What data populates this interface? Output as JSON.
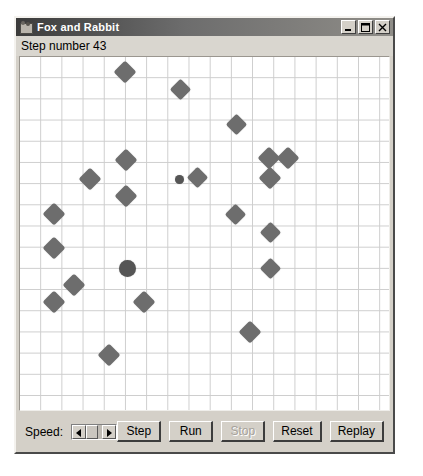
{
  "window": {
    "title": "Fox and Rabbit",
    "icon": "application-icon",
    "controls": [
      {
        "name": "minimize-button",
        "glyph": "minimize-icon",
        "label": "Minimize"
      },
      {
        "name": "maximize-button",
        "glyph": "maximize-icon",
        "label": "Maximize"
      },
      {
        "name": "close-button",
        "glyph": "close-icon",
        "label": "Close"
      }
    ]
  },
  "status": {
    "step_text": "Step number 43",
    "step_number": 43
  },
  "field": {
    "grid_cell_px": 21.2,
    "grid_color": "#cdcdcd",
    "background": "#ffffff",
    "rabbit_color": "#6d6d6d",
    "fox_color": "#555555",
    "rabbit_count": 23,
    "fox_count": 2,
    "actors": [
      {
        "type": "rabbit",
        "x": 105,
        "y": 15,
        "size": 16
      },
      {
        "type": "rabbit",
        "x": 160,
        "y": 32,
        "size": 15
      },
      {
        "type": "rabbit",
        "x": 216,
        "y": 67,
        "size": 15
      },
      {
        "type": "rabbit",
        "x": 106,
        "y": 103,
        "size": 16
      },
      {
        "type": "rabbit",
        "x": 249,
        "y": 101,
        "size": 16
      },
      {
        "type": "rabbit",
        "x": 268,
        "y": 101,
        "size": 16
      },
      {
        "type": "fox",
        "x": 159,
        "y": 122,
        "size": 9
      },
      {
        "type": "rabbit",
        "x": 177,
        "y": 120,
        "size": 15
      },
      {
        "type": "rabbit",
        "x": 70,
        "y": 122,
        "size": 16
      },
      {
        "type": "rabbit",
        "x": 250,
        "y": 121,
        "size": 16
      },
      {
        "type": "rabbit",
        "x": 106,
        "y": 139,
        "size": 16
      },
      {
        "type": "rabbit",
        "x": 34,
        "y": 157,
        "size": 16
      },
      {
        "type": "rabbit",
        "x": 215,
        "y": 157,
        "size": 15
      },
      {
        "type": "rabbit",
        "x": 250,
        "y": 175,
        "size": 15
      },
      {
        "type": "rabbit",
        "x": 34,
        "y": 191,
        "size": 16
      },
      {
        "type": "fox",
        "x": 107,
        "y": 211,
        "size": 17
      },
      {
        "type": "rabbit",
        "x": 250,
        "y": 211,
        "size": 15
      },
      {
        "type": "rabbit",
        "x": 54,
        "y": 228,
        "size": 16
      },
      {
        "type": "rabbit",
        "x": 34,
        "y": 245,
        "size": 16
      },
      {
        "type": "rabbit",
        "x": 124,
        "y": 245,
        "size": 16
      },
      {
        "type": "rabbit",
        "x": 230,
        "y": 275,
        "size": 16
      },
      {
        "type": "rabbit",
        "x": 89,
        "y": 298,
        "size": 16
      }
    ]
  },
  "controls": {
    "speed_label": "Speed:",
    "slider": {
      "name": "speed-slider",
      "left_arrow": "scroll-left-icon",
      "right_arrow": "scroll-right-icon",
      "thumb_fraction": 0.73
    },
    "buttons": [
      {
        "name": "step-button",
        "label": "Step",
        "disabled": false
      },
      {
        "name": "run-button",
        "label": "Run",
        "disabled": false
      },
      {
        "name": "stop-button",
        "label": "Stop",
        "disabled": true
      },
      {
        "name": "reset-button",
        "label": "Reset",
        "disabled": false
      },
      {
        "name": "replay-button",
        "label": "Replay",
        "disabled": false
      }
    ]
  }
}
